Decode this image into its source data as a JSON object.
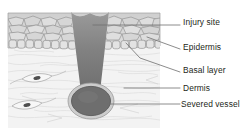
{
  "diagram": {
    "palette": {
      "background": "#ffffff",
      "epidermis_fill": "#d2d2d2",
      "epidermis_cell_stroke": "#8c8c8c",
      "basal_cell_fill": "#dcdcdc",
      "dermis_fill": "#f2f2f2",
      "dermis_fiber": "#d9d9d9",
      "wound_fill_top": "#8d8d8d",
      "wound_fill_bottom": "#6e6e6e",
      "vessel_fill": "#6b6b6b",
      "vessel_ring": "#c9c9c9",
      "vessel_stroke": "#5a5a5a",
      "fibroblast_stroke": "#9a9a9a",
      "nucleus_fill": "#4d4d4d",
      "leader_line": "#6e6e6e",
      "label_text": "#231f20"
    },
    "labels": [
      {
        "id": "injury-site",
        "text": "Injury site",
        "x": 183,
        "y": 18
      },
      {
        "id": "epidermis",
        "text": "Epidermis",
        "x": 183,
        "y": 43
      },
      {
        "id": "basal-layer",
        "text": "Basal layer",
        "x": 183,
        "y": 66
      },
      {
        "id": "dermis",
        "text": "Dermis",
        "x": 183,
        "y": 84
      },
      {
        "id": "severed-vessel",
        "text": "Severed vessel",
        "x": 183,
        "y": 101
      }
    ],
    "regions": [
      {
        "id": "epidermis-region",
        "name": "epidermis"
      },
      {
        "id": "basal-region",
        "name": "basal-layer"
      },
      {
        "id": "dermis-region",
        "name": "dermis"
      },
      {
        "id": "wound-region",
        "name": "injury-site"
      },
      {
        "id": "vessel-region",
        "name": "severed-vessel"
      }
    ],
    "counts": {
      "fibroblasts": 2,
      "leader_lines": 5
    }
  }
}
